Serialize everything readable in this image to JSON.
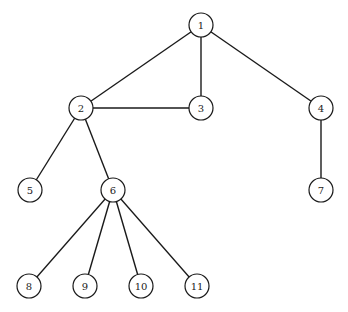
{
  "diagram": {
    "type": "tree",
    "node_radius": 12,
    "nodes": [
      {
        "id": "1",
        "label": "1",
        "x": 201,
        "y": 25
      },
      {
        "id": "2",
        "label": "2",
        "x": 81,
        "y": 108
      },
      {
        "id": "3",
        "label": "3",
        "x": 201,
        "y": 108
      },
      {
        "id": "4",
        "label": "4",
        "x": 321,
        "y": 108
      },
      {
        "id": "5",
        "label": "5",
        "x": 30,
        "y": 190
      },
      {
        "id": "6",
        "label": "6",
        "x": 113,
        "y": 190
      },
      {
        "id": "7",
        "label": "7",
        "x": 321,
        "y": 190
      },
      {
        "id": "8",
        "label": "8",
        "x": 29,
        "y": 286
      },
      {
        "id": "9",
        "label": "9",
        "x": 85,
        "y": 286
      },
      {
        "id": "10",
        "label": "10",
        "x": 141,
        "y": 286
      },
      {
        "id": "11",
        "label": "11",
        "x": 197,
        "y": 286
      }
    ],
    "edges": [
      [
        "1",
        "2"
      ],
      [
        "1",
        "3"
      ],
      [
        "1",
        "4"
      ],
      [
        "2",
        "3"
      ],
      [
        "2",
        "5"
      ],
      [
        "2",
        "6"
      ],
      [
        "4",
        "7"
      ],
      [
        "6",
        "8"
      ],
      [
        "6",
        "9"
      ],
      [
        "6",
        "10"
      ],
      [
        "6",
        "11"
      ]
    ]
  }
}
